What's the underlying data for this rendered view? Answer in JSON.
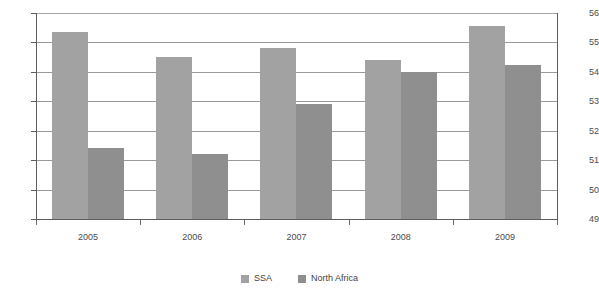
{
  "chart_data": {
    "type": "bar",
    "title": "",
    "subtitle": "",
    "xlabel": "",
    "ylabel": "",
    "categories": [
      "2005",
      "2006",
      "2007",
      "2008",
      "2009"
    ],
    "series": [
      {
        "name": "SSA",
        "color": "#a2a2a2",
        "values": [
          55.35,
          54.5,
          54.8,
          54.4,
          55.55
        ]
      },
      {
        "name": "North Africa",
        "color": "#8f8f8f",
        "values": [
          51.4,
          51.2,
          52.9,
          54.0,
          54.25
        ]
      }
    ],
    "ylim": [
      49,
      56
    ],
    "ytick_labels": [
      "56",
      "55",
      "54",
      "53",
      "52",
      "51",
      "50",
      "49"
    ],
    "ytick_values": [
      56,
      55,
      54,
      53,
      52,
      51,
      50,
      49
    ],
    "grid": true,
    "legend_position": "bottom-center"
  },
  "legend": {
    "items": [
      {
        "label": "SSA"
      },
      {
        "label": "North Africa"
      }
    ]
  }
}
